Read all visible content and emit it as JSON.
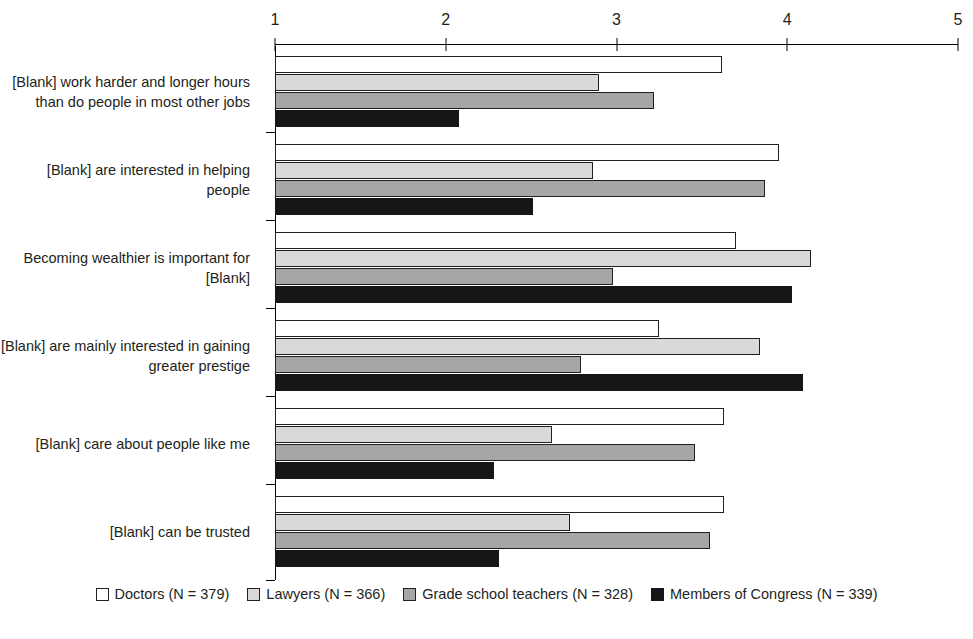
{
  "chart_data": {
    "type": "bar",
    "orientation": "horizontal",
    "title": "",
    "subtitle": "",
    "xlabel": "",
    "ylabel": "",
    "xlim": [
      1,
      5
    ],
    "xticks": [
      "1",
      "2",
      "3",
      "4",
      "5"
    ],
    "grid": false,
    "legend_position": "bottom",
    "categories": [
      "[Blank] work harder and longer hours than do people in most other jobs",
      "[Blank] are interested in helping people",
      "Becoming wealthier is important for [Blank]",
      "[Blank] are mainly interested in gaining greater prestige",
      "[Blank] care about people like me",
      "[Blank] can be trusted"
    ],
    "series": [
      {
        "name": "Doctors (N = 379)",
        "color": "#ffffff",
        "values": [
          3.62,
          3.95,
          3.7,
          3.25,
          3.63,
          3.63
        ]
      },
      {
        "name": "Lawyers (N = 366)",
        "color": "#d9d9d9",
        "values": [
          2.9,
          2.86,
          4.14,
          3.84,
          2.62,
          2.73
        ]
      },
      {
        "name": "Grade school teachers (N = 328)",
        "color": "#a6a6a6",
        "values": [
          3.22,
          3.87,
          2.98,
          2.79,
          3.46,
          3.55
        ]
      },
      {
        "name": "Members of Congress (N = 339)",
        "color": "#161616",
        "values": [
          2.08,
          2.51,
          4.03,
          4.09,
          2.28,
          2.31
        ]
      }
    ]
  }
}
